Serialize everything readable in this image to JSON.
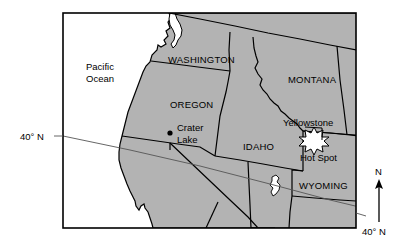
{
  "figure": {
    "kind": "reference-map",
    "region": "Pacific Northwest and Northern Rocky Mountains, United States"
  },
  "colors": {
    "land_fill": "#b3b3b3",
    "water_fill": "#ffffff",
    "ocean_fill": "#ffffff",
    "frame_stroke": "#000000",
    "border_stroke": "#000000",
    "latitude_stroke": "#555555",
    "text": "#000000",
    "marker": "#000000",
    "hotspot_fill": "#ffffff"
  },
  "labels": {
    "ocean": {
      "line1": "Pacific",
      "line2": "Ocean"
    },
    "states": {
      "washington": "WASHINGTON",
      "oregon": "OREGON",
      "montana": "MONTANA",
      "idaho": "IDAHO",
      "wyoming": "WYOMING"
    },
    "places": {
      "crater_lake_line1": "Crater",
      "crater_lake_line2": "Lake",
      "yellowstone": "Yellowstone",
      "hot_spot": "Hot Spot"
    },
    "latitude_left": "40° N",
    "latitude_right": "40° N",
    "compass_north": "N"
  }
}
